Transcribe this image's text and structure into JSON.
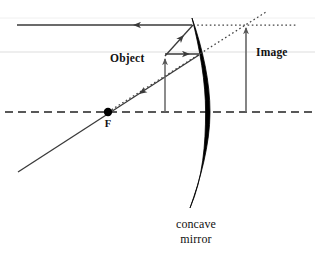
{
  "figure": {
    "background_color": "#ffffff",
    "ink_color": "#3a3a3a",
    "mirror_color": "#000000",
    "label_color": "#111111",
    "artifact_line_color": "#d8d8d8"
  },
  "labels": {
    "object": "Object",
    "image": "Image",
    "focal_point": "F",
    "mirror_line1": "concave",
    "mirror_line2": "mirror"
  },
  "geometry": {
    "axis": {
      "name": "principal-axis",
      "style": "dashed",
      "y": 112,
      "x_start": 5,
      "x_end": 312
    },
    "mirror": {
      "name": "concave-mirror",
      "top": [
        192,
        18
      ],
      "vertex": [
        210,
        112
      ],
      "bottom": [
        190,
        208
      ],
      "max_thickness": 4.4,
      "orientation": "reflecting-surface-faces-left"
    },
    "focal_point": {
      "x": 108,
      "y": 112,
      "radius": 4.2
    },
    "object_arrow": {
      "base": [
        165,
        112
      ],
      "tip": [
        165,
        56
      ],
      "height_px": 56
    },
    "image_arrow": {
      "base": [
        246,
        112
      ],
      "tip": [
        246,
        25
      ],
      "height_px": 87
    },
    "rays": [
      {
        "name": "parallel-incident-ray",
        "type": "solid",
        "from": [
          192,
          25
        ],
        "to": [
          17,
          25
        ],
        "arrow_at": [
          135,
          25
        ],
        "direction": "leftward",
        "note": "reflected ray travelling parallel to axis after striking mirror top"
      },
      {
        "name": "object-to-mirror-top-ray",
        "type": "solid",
        "from": [
          165,
          56
        ],
        "to": [
          192,
          26
        ],
        "arrow_at": [
          185,
          33
        ],
        "direction": "up-right"
      },
      {
        "name": "object-to-mirror-horizontal-ray",
        "type": "solid",
        "from": [
          165,
          54
        ],
        "to": [
          198,
          54
        ],
        "arrow_at": [
          190,
          54
        ],
        "direction": "rightward"
      },
      {
        "name": "focal-ray-through-F",
        "type": "solid",
        "from": [
          198,
          55
        ],
        "to": [
          18,
          172
        ],
        "arrow_at": [
          141,
          93
        ],
        "direction": "down-left",
        "note": "passes through focal point F"
      }
    ],
    "construction_lines": [
      {
        "name": "horizontal-dotted-extension",
        "type": "dotted",
        "from": [
          193,
          25
        ],
        "to": [
          297,
          25
        ]
      },
      {
        "name": "diagonal-dotted-extension",
        "type": "dotted",
        "from": [
          108,
          112
        ],
        "to": [
          266,
          12
        ],
        "note": "virtual extension from F through object tip to image tip"
      }
    ],
    "artifacts": [
      {
        "name": "scan-artifact-line",
        "y": 52,
        "x_start": 0,
        "x_end": 315
      }
    ]
  }
}
